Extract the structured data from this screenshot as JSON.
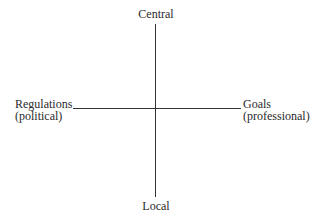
{
  "diagram": {
    "type": "quadrant-axes",
    "axes": {
      "vertical": {
        "top_label": "Central",
        "bottom_label": "Local"
      },
      "horizontal": {
        "left_label": {
          "line1": "Regulations",
          "line2": "(political)"
        },
        "right_label": {
          "line1": "Goals",
          "line2": "(professional)"
        }
      }
    },
    "colors": {
      "line": "#333333",
      "text": "#2a2a2a",
      "background": "#ffffff"
    }
  }
}
